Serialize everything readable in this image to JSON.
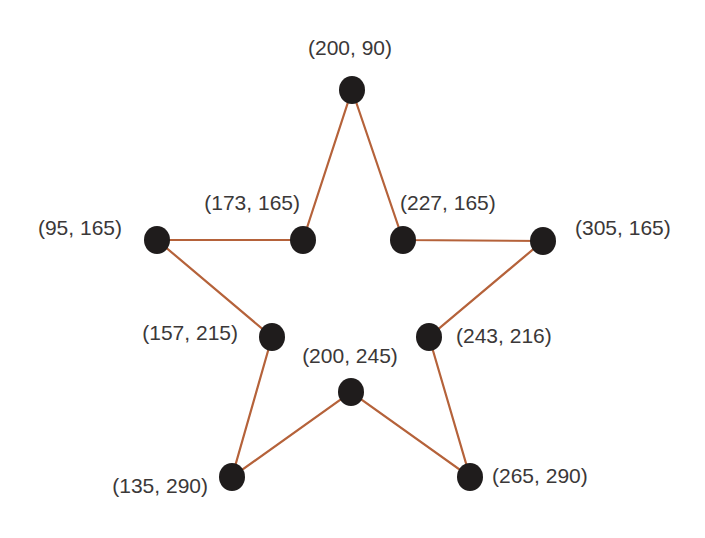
{
  "diagram": {
    "type": "star-polygon",
    "colors": {
      "edge": "#b5623a",
      "node": "#1f1c1c",
      "label": "#3b3838",
      "background": "#ffffff"
    },
    "node_radius": 13,
    "points": [
      {
        "id": "p1",
        "label": "(200, 90)",
        "x": 352,
        "y": 90,
        "lx": 350,
        "ly": 55,
        "anchor": "middle"
      },
      {
        "id": "p2",
        "label": "(227, 165)",
        "x": 403,
        "y": 240,
        "lx": 400,
        "ly": 210,
        "anchor": "start"
      },
      {
        "id": "p3",
        "label": "(305, 165)",
        "x": 543,
        "y": 241,
        "lx": 575,
        "ly": 235,
        "anchor": "start"
      },
      {
        "id": "p4",
        "label": "(243, 216)",
        "x": 429,
        "y": 337,
        "lx": 456,
        "ly": 343,
        "anchor": "start"
      },
      {
        "id": "p5",
        "label": "(265, 290)",
        "x": 470,
        "y": 477,
        "lx": 492,
        "ly": 483,
        "anchor": "start"
      },
      {
        "id": "p6",
        "label": "(200, 245)",
        "x": 351,
        "y": 392,
        "lx": 350,
        "ly": 363,
        "anchor": "middle"
      },
      {
        "id": "p7",
        "label": "(135, 290)",
        "x": 232,
        "y": 477,
        "lx": 208,
        "ly": 493,
        "anchor": "end"
      },
      {
        "id": "p8",
        "label": "(157, 215)",
        "x": 272,
        "y": 337,
        "lx": 238,
        "ly": 340,
        "anchor": "end"
      },
      {
        "id": "p9",
        "label": "(95, 165)",
        "x": 157,
        "y": 240,
        "lx": 122,
        "ly": 235,
        "anchor": "end"
      },
      {
        "id": "p10",
        "label": "(173, 165)",
        "x": 303,
        "y": 240,
        "lx": 300,
        "ly": 210,
        "anchor": "end"
      }
    ]
  }
}
